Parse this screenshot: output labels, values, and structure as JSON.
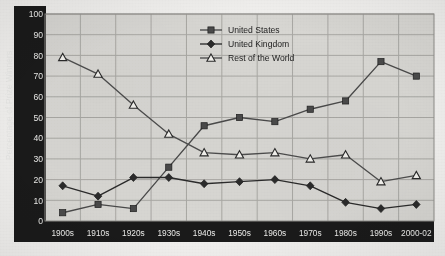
{
  "chart_data": {
    "type": "line",
    "title": "",
    "xlabel": "",
    "ylabel": "Percentage of Prize Winners",
    "ylim": [
      0,
      100
    ],
    "ytick_step": 10,
    "yticks": [
      "0",
      "10",
      "20",
      "30",
      "40",
      "50",
      "60",
      "70",
      "80",
      "90",
      "100"
    ],
    "grid": true,
    "legend_position": "top-center-right",
    "categories": [
      "1900s",
      "1910s",
      "1920s",
      "1930s",
      "1940s",
      "1950s",
      "1960s",
      "1970s",
      "1980s",
      "1990s",
      "2000-02"
    ],
    "series": [
      {
        "name": "United States",
        "marker": "filled-square",
        "color": "#4a4a4a",
        "values": [
          4,
          8,
          6,
          26,
          46,
          50,
          48,
          54,
          58,
          77,
          70
        ]
      },
      {
        "name": "United Kingdom",
        "marker": "filled-diamond",
        "color": "#2b2b2b",
        "values": [
          17,
          12,
          21,
          21,
          18,
          19,
          20,
          17,
          9,
          6,
          8
        ]
      },
      {
        "name": "Rest of the World",
        "marker": "open-triangle",
        "color": "#4d4d4d",
        "values": [
          79,
          71,
          56,
          42,
          33,
          32,
          33,
          30,
          32,
          19,
          22
        ]
      }
    ]
  },
  "axes": {
    "y_axis_label": "Percentage of Prize Winners",
    "x_axis_name": "decade-axis",
    "y_band_color": "#1a1a1a",
    "x_band_color": "#1a1a1a",
    "plot_bg_color": "#d8d7d3",
    "grid_color": "#a9a8a4"
  },
  "legend": {
    "items": [
      {
        "label": "United States",
        "icon": "filled-square-marker"
      },
      {
        "label": "United Kingdom",
        "icon": "filled-diamond-marker"
      },
      {
        "label": "Rest of the World",
        "icon": "open-triangle-marker"
      }
    ]
  }
}
